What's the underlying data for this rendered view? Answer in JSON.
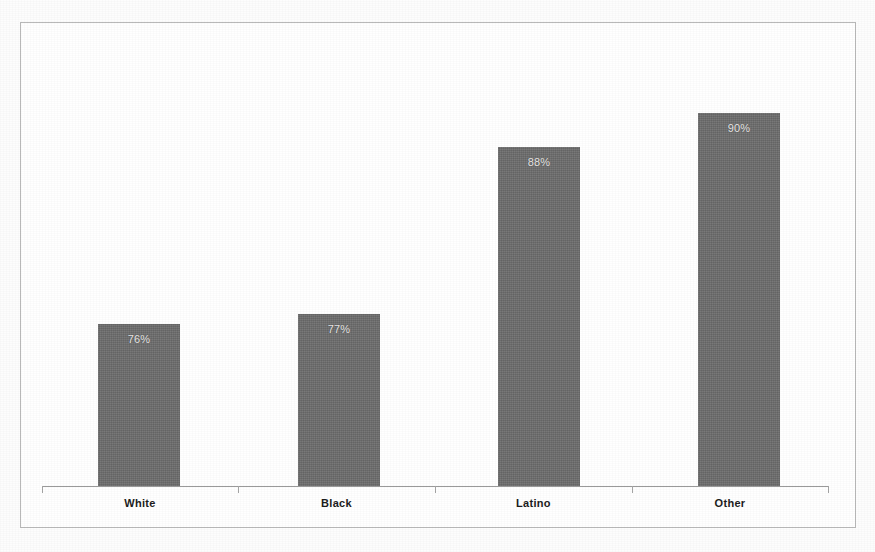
{
  "chart_data": {
    "type": "bar",
    "title": "",
    "subtitle": "",
    "xlabel": "",
    "ylabel": "",
    "categories": [
      "White",
      "Black",
      "Latino",
      "Other"
    ],
    "values": [
      76,
      77,
      88,
      90
    ],
    "value_labels": [
      "76%",
      "77%",
      "88%",
      "90%"
    ],
    "value_unit": "%",
    "ylim": [
      66,
      100
    ],
    "grid": false,
    "legend": null,
    "y_axis_visible": false,
    "y_tick_labels": [],
    "orientation": "vertical",
    "series": [
      {
        "name": "",
        "values": [
          76,
          77,
          88,
          90
        ]
      }
    ],
    "colors": {
      "bar_fill": "#6e6e6e",
      "value_label": "#eceaea",
      "category_label": "#1c1c1c",
      "axis_line": "#9a9a9a",
      "frame_border": "#b9b9b9",
      "background": "#ffffff"
    },
    "annotations": []
  },
  "bars": [
    {
      "category": "White",
      "label": "76%",
      "left": 98,
      "width": 82,
      "top": 324,
      "height": 162
    },
    {
      "category": "Black",
      "label": "77%",
      "left": 298,
      "width": 82,
      "top": 314,
      "height": 172
    },
    {
      "category": "Latino",
      "label": "88%",
      "left": 498,
      "width": 82,
      "top": 147,
      "height": 339
    },
    {
      "category": "Other",
      "label": "90%",
      "left": 698,
      "width": 82,
      "top": 113,
      "height": 373
    }
  ],
  "ticks": [
    42,
    238,
    435,
    632,
    828
  ],
  "category_slots": [
    {
      "label": "White",
      "left": 42,
      "width": 196
    },
    {
      "label": "Black",
      "left": 238,
      "width": 197
    },
    {
      "label": "Latino",
      "left": 435,
      "width": 197
    },
    {
      "label": "Other",
      "left": 632,
      "width": 196
    }
  ]
}
